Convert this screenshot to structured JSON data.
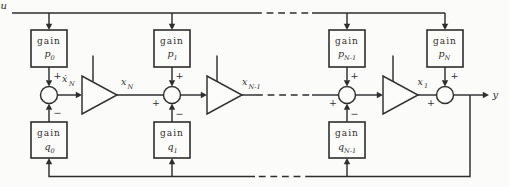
{
  "figure": {
    "input_label": "u",
    "output_label": "y",
    "gain_word": "gain",
    "plus_sign": "+",
    "minus_sign": "−",
    "p_gains": [
      {
        "base": "p",
        "sub": "0"
      },
      {
        "base": "p",
        "sub": "1"
      },
      {
        "base": "p",
        "sub": "N-1"
      },
      {
        "base": "p",
        "sub": "N"
      }
    ],
    "q_gains": [
      {
        "base": "q",
        "sub": "0"
      },
      {
        "base": "q",
        "sub": "1"
      },
      {
        "base": "q",
        "sub": "N-1"
      }
    ],
    "signals": {
      "xdotN": {
        "base": "ẋ",
        "sub": "N"
      },
      "xN": {
        "base": "x",
        "sub": "N"
      },
      "xNm1": {
        "base": "x",
        "sub": "N-1"
      },
      "x1": {
        "base": "x",
        "sub": "1"
      }
    },
    "colors": {
      "ink": "#2e2e2e",
      "paper": "#fbfbf9"
    }
  }
}
